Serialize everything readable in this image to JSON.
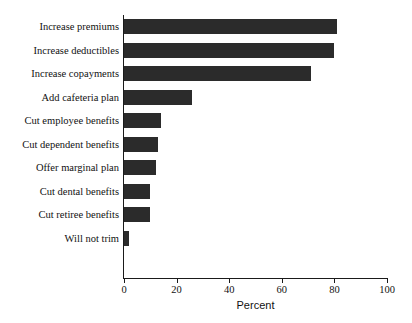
{
  "chart_data": {
    "type": "bar",
    "orientation": "horizontal",
    "title": "",
    "xlabel": "Percent",
    "ylabel": "",
    "xlim": [
      0,
      100
    ],
    "xticks": [
      0,
      20,
      40,
      60,
      80,
      100
    ],
    "xtick_labels": [
      "0",
      "20",
      "40",
      "60",
      "80",
      "100"
    ],
    "grid": false,
    "legend": false,
    "bar_color": "#2b2b2b",
    "axis_color": "#1a1a1a",
    "background": "#ffffff",
    "categories": [
      "Increase premiums",
      "Increase deductibles",
      "Increase copayments",
      "Add cafeteria plan",
      "Cut employee benefits",
      "Cut dependent benefits",
      "Offer marginal plan",
      "Cut dental benefits",
      "Cut retiree benefits",
      "Will not trim"
    ],
    "values": [
      81,
      80,
      71,
      26,
      14,
      13,
      12,
      10,
      10,
      2
    ]
  }
}
